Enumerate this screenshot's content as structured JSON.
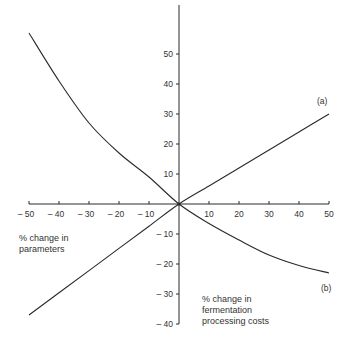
{
  "chart_data": {
    "type": "line",
    "title": "",
    "xlabel": "% change in parameters",
    "ylabel": "% change in fermentation processing costs",
    "xlim": [
      -50,
      50
    ],
    "ylim": [
      -40,
      55
    ],
    "grid": false,
    "legend": "inline labels at line ends",
    "x_ticks": [
      -50,
      -40,
      -30,
      -20,
      -10,
      10,
      20,
      30,
      40,
      50
    ],
    "x_tick_labels": [
      "– 50",
      "– 40",
      "– 30",
      "– 20",
      "– 10",
      "10",
      "20",
      "30",
      "40",
      "50"
    ],
    "y_ticks": [
      50,
      40,
      30,
      20,
      10,
      -10,
      -20,
      -30,
      -40
    ],
    "y_tick_labels": [
      "50",
      "40",
      "30",
      "20",
      "10",
      "– 10",
      "– 20",
      "– 30",
      "– 40"
    ],
    "series": [
      {
        "name": "(a)",
        "x": [
          -50,
          -40,
          -30,
          -20,
          -10,
          0,
          10,
          20,
          30,
          40,
          50
        ],
        "y": [
          -37,
          -29.6,
          -22.2,
          -14.8,
          -7.4,
          0,
          6,
          12,
          18,
          24,
          30
        ]
      },
      {
        "name": "(b)",
        "x": [
          -50,
          -40,
          -30,
          -20,
          -10,
          0,
          10,
          20,
          30,
          40,
          50
        ],
        "y": [
          57,
          41,
          27,
          17,
          9,
          0,
          -6.5,
          -12,
          -17,
          -20.5,
          -23
        ]
      }
    ],
    "annotations": [
      {
        "text": "(a)",
        "near": "end of line a at x=50"
      },
      {
        "text": "(b)",
        "near": "end of curve b at x=50"
      }
    ]
  },
  "labels": {
    "x_axis_title_line1": "% change in",
    "x_axis_title_line2": "parameters",
    "y_axis_title_line1": "% change in",
    "y_axis_title_line2": "fermentation",
    "y_axis_title_line3": "processing costs",
    "series_a": "(a)",
    "series_b": "(b)"
  },
  "colors": {
    "ink": "#2a2a2a",
    "background": "#ffffff"
  }
}
